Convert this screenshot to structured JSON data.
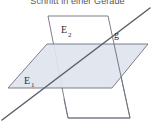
{
  "caption": {
    "text": "Schnitt in einer Gerade",
    "color": "#58585a"
  },
  "figure": {
    "background": "#ffffff",
    "plane_fill": "#dfe4ee",
    "plane_fill_light": "#ffffff",
    "plane_stroke": "#6d7280",
    "line_color": "#5a5f68",
    "label_color": "#2d2d33"
  },
  "labels": {
    "plane1": "E",
    "plane1_sub": "1",
    "plane2": "E",
    "plane2_sub": "2",
    "line": "g"
  },
  "geometry": {
    "plane1_points": "8,88 47,44 148,44 112,88",
    "plane2_points": "48,16 108,16 130,118 68,118",
    "line_g": {
      "x1": 2,
      "y1": 120,
      "x2": 150,
      "y2": 8
    }
  }
}
